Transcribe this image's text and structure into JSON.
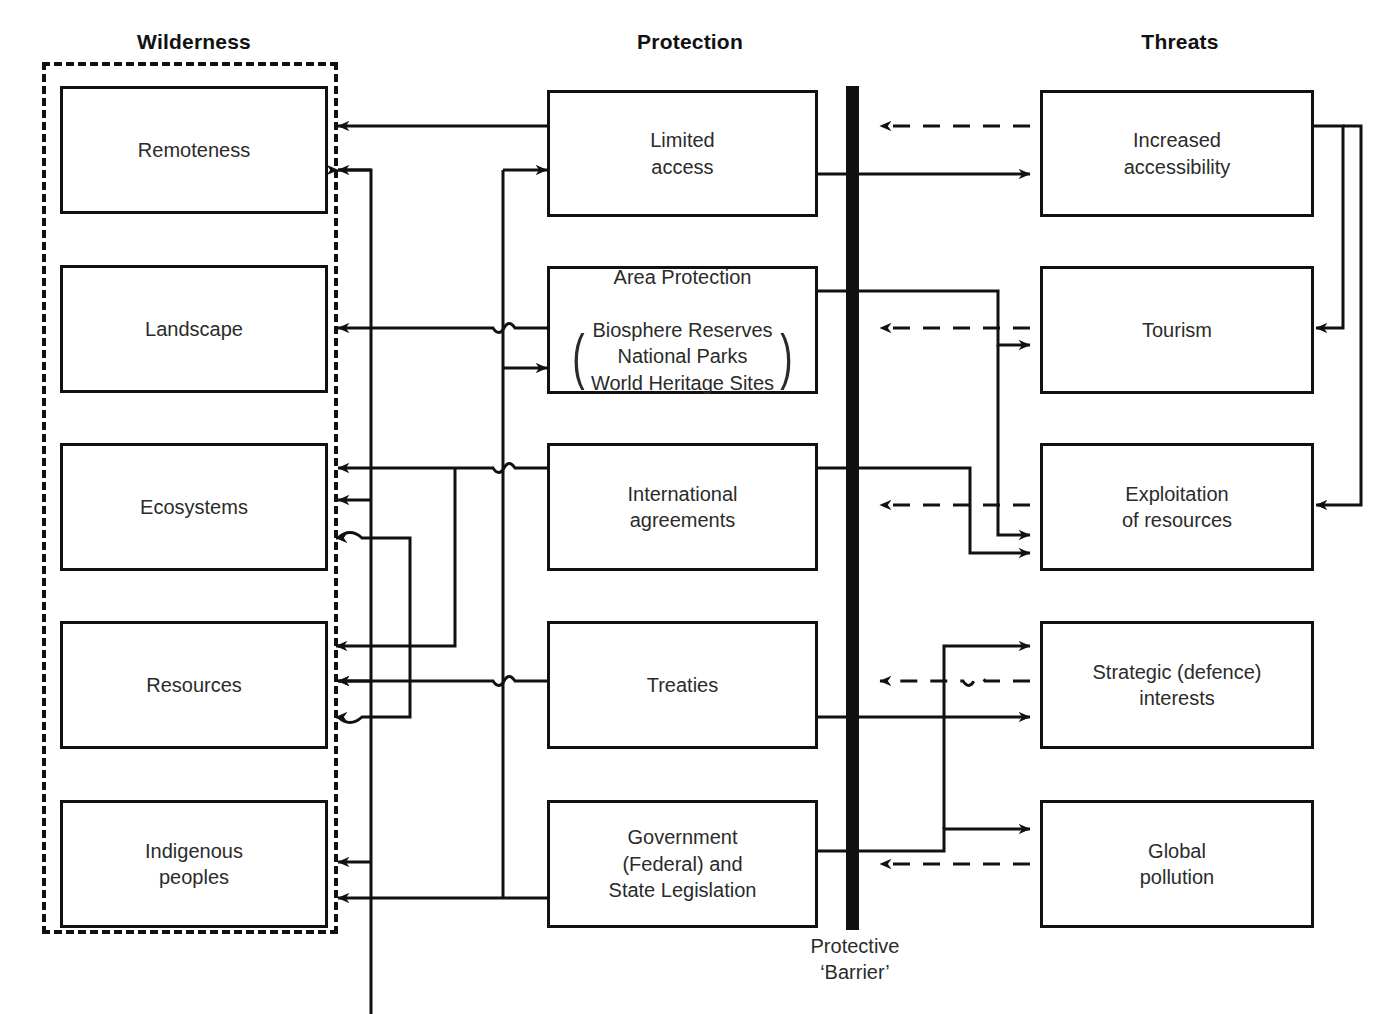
{
  "diagram": {
    "columns": [
      {
        "key": "wilderness",
        "label": "Wilderness",
        "x": 194
      },
      {
        "key": "protection",
        "label": "Protection",
        "x": 690
      },
      {
        "key": "threats",
        "label": "Threats",
        "x": 1180
      }
    ],
    "barrier": {
      "caption": "Protective\n‘Barrier’",
      "color": "#111111",
      "x": 846,
      "width": 13,
      "top": 86,
      "bottom": 930
    },
    "wilderness_nodes": [
      {
        "id": "remoteness",
        "label": "Remoteness"
      },
      {
        "id": "landscape",
        "label": "Landscape"
      },
      {
        "id": "ecosystems",
        "label": "Ecosystems"
      },
      {
        "id": "resources",
        "label": "Resources"
      },
      {
        "id": "indigenous-peoples",
        "label": "Indigenous\npeoples"
      }
    ],
    "protection_nodes": [
      {
        "id": "limited-access",
        "label": "Limited\naccess"
      },
      {
        "id": "area-protection",
        "label": "Area Protection",
        "grouped_items": "Biosphere Reserves\nNational Parks\nWorld Heritage Sites",
        "bracket_left": "(",
        "bracket_right": ")"
      },
      {
        "id": "international-agreements",
        "label": "International\nagreements"
      },
      {
        "id": "treaties",
        "label": "Treaties"
      },
      {
        "id": "government-legislation",
        "label": "Government\n(Federal) and\nState Legislation"
      }
    ],
    "threat_nodes": [
      {
        "id": "increased-accessibility",
        "label": "Increased\naccessibility"
      },
      {
        "id": "tourism",
        "label": "Tourism"
      },
      {
        "id": "exploitation-of-resources",
        "label": "Exploitation\nof resources"
      },
      {
        "id": "strategic-defence-interests",
        "label": "Strategic (defence)\ninterests"
      },
      {
        "id": "global-pollution",
        "label": "Global\npollution"
      }
    ],
    "legend": {
      "solid_meaning": "protective / causal link crossing the barrier",
      "dashed_meaning": "threat blocked by the protective barrier"
    }
  }
}
